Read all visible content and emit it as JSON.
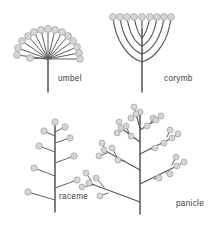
{
  "figure": {
    "background_color": "#ffffff",
    "stem_color": "#55525a",
    "bud_fill_color": "#d6d4d8",
    "bud_stroke_color": "#a9a6ad",
    "label_color": "#3d3b40"
  },
  "panels": {
    "umbel": {
      "label": "umbel",
      "label_x": 58,
      "label_y": 81,
      "hub": {
        "x": 48,
        "y": 59
      },
      "stem_bottom_y": 92,
      "ray_count": 15,
      "rays": [
        {
          "tip_x": 17,
          "tip_y": 55,
          "bud_r": 3.4
        },
        {
          "tip_x": 18,
          "tip_y": 48,
          "bud_r": 3.4
        },
        {
          "tip_x": 22,
          "tip_y": 41,
          "bud_r": 3.4
        },
        {
          "tip_x": 28,
          "tip_y": 36,
          "bud_r": 3.4
        },
        {
          "tip_x": 34,
          "tip_y": 32,
          "bud_r": 3.4
        },
        {
          "tip_x": 41,
          "tip_y": 30,
          "bud_r": 3.4
        },
        {
          "tip_x": 48,
          "tip_y": 29,
          "bud_r": 3.4
        },
        {
          "tip_x": 55,
          "tip_y": 30,
          "bud_r": 3.4
        },
        {
          "tip_x": 62,
          "tip_y": 32,
          "bud_r": 3.4
        },
        {
          "tip_x": 68,
          "tip_y": 36,
          "bud_r": 3.4
        },
        {
          "tip_x": 73,
          "tip_y": 41,
          "bud_r": 3.4
        },
        {
          "tip_x": 77,
          "tip_y": 47,
          "bud_r": 3.4
        },
        {
          "tip_x": 79,
          "tip_y": 53,
          "bud_r": 3.4
        },
        {
          "tip_x": 80,
          "tip_y": 59,
          "bud_r": 3.4
        },
        {
          "tip_x": 30,
          "tip_y": 58,
          "bud_r": 3.4
        }
      ]
    },
    "corymb": {
      "label": "corymb",
      "label_x": 164,
      "label_y": 81,
      "axis_x": 142,
      "axis_top_y": 30,
      "axis_bottom_y": 92,
      "flower_top_y": 17,
      "bud_r": 3.4,
      "branch_count": 9,
      "branches": [
        {
          "side": "left",
          "tip_x": 113,
          "attach_y": 62
        },
        {
          "side": "left",
          "tip_x": 120,
          "attach_y": 54
        },
        {
          "side": "left",
          "tip_x": 127,
          "attach_y": 46
        },
        {
          "side": "left",
          "tip_x": 134,
          "attach_y": 38
        },
        {
          "side": "center",
          "tip_x": 142,
          "attach_y": 30
        },
        {
          "side": "right",
          "tip_x": 150,
          "attach_y": 38
        },
        {
          "side": "right",
          "tip_x": 157,
          "attach_y": 46
        },
        {
          "side": "right",
          "tip_x": 164,
          "attach_y": 54
        },
        {
          "side": "right",
          "tip_x": 171,
          "attach_y": 62
        }
      ]
    },
    "raceme": {
      "label": "raceme",
      "label_x": 59,
      "label_y": 199,
      "axis_x": 55,
      "axis_top_y": 130,
      "axis_bottom_y": 212,
      "bud_r": 3.2,
      "flower_count": 9,
      "pedicels": [
        {
          "side": "left",
          "attach_y": 200,
          "tip_x": 28,
          "tip_y": 192
        },
        {
          "side": "right",
          "attach_y": 188,
          "tip_x": 77,
          "tip_y": 180
        },
        {
          "side": "left",
          "attach_y": 176,
          "tip_x": 34,
          "tip_y": 168
        },
        {
          "side": "right",
          "attach_y": 163,
          "tip_x": 74,
          "tip_y": 156
        },
        {
          "side": "left",
          "attach_y": 152,
          "tip_x": 39,
          "tip_y": 146
        },
        {
          "side": "right",
          "attach_y": 143,
          "tip_x": 70,
          "tip_y": 138
        },
        {
          "side": "left",
          "attach_y": 136,
          "tip_x": 44,
          "tip_y": 131
        },
        {
          "side": "right",
          "attach_y": 132,
          "tip_x": 65,
          "tip_y": 127
        },
        {
          "side": "center",
          "attach_y": 130,
          "tip_x": 55,
          "tip_y": 122
        }
      ]
    },
    "panicle": {
      "label": "panicle",
      "label_x": 176,
      "label_y": 206,
      "axis_x": 140,
      "axis_top_y": 128,
      "axis_bottom_y": 214,
      "bud_r": 3.0,
      "branches": [
        {
          "attach_y": 202,
          "tip_x": 89,
          "tip_y": 183,
          "sub_buds": [
            {
              "x": 100,
              "y": 196,
              "branch_x": 108,
              "branch_y": 193
            },
            {
              "x": 96,
              "y": 178,
              "branch_x": 104,
              "branch_y": 187
            },
            {
              "x": 82,
              "y": 187,
              "branch_x": 93,
              "branch_y": 185
            },
            {
              "x": 86,
              "y": 173,
              "branch_x": 92,
              "branch_y": 182
            }
          ]
        },
        {
          "attach_y": 184,
          "tip_x": 177,
          "tip_y": 166,
          "sub_buds": [
            {
              "x": 159,
              "y": 178,
              "branch_x": 154,
              "branch_y": 179
            },
            {
              "x": 170,
              "y": 174,
              "branch_x": 166,
              "branch_y": 173
            },
            {
              "x": 184,
              "y": 162,
              "branch_x": 177,
              "branch_y": 166
            },
            {
              "x": 176,
              "y": 157,
              "branch_x": 172,
              "branch_y": 165
            }
          ]
        },
        {
          "attach_y": 170,
          "tip_x": 104,
          "tip_y": 150,
          "sub_buds": [
            {
              "x": 118,
              "y": 160,
              "branch_x": 124,
              "branch_y": 161
            },
            {
              "x": 112,
              "y": 148,
              "branch_x": 117,
              "branch_y": 157
            },
            {
              "x": 99,
              "y": 156,
              "branch_x": 107,
              "branch_y": 153
            },
            {
              "x": 102,
              "y": 143,
              "branch_x": 106,
              "branch_y": 151
            }
          ]
        },
        {
          "attach_y": 154,
          "tip_x": 172,
          "tip_y": 138,
          "sub_buds": [
            {
              "x": 155,
              "y": 148,
              "branch_x": 151,
              "branch_y": 149
            },
            {
              "x": 164,
              "y": 143,
              "branch_x": 161,
              "branch_y": 144
            },
            {
              "x": 178,
              "y": 134,
              "branch_x": 172,
              "branch_y": 138
            },
            {
              "x": 170,
              "y": 130,
              "branch_x": 167,
              "branch_y": 137
            }
          ]
        },
        {
          "attach_y": 142,
          "tip_x": 121,
          "tip_y": 128,
          "sub_buds": [
            {
              "x": 131,
              "y": 136,
              "branch_x": 134,
              "branch_y": 138
            },
            {
              "x": 126,
              "y": 126,
              "branch_x": 129,
              "branch_y": 133
            },
            {
              "x": 117,
              "y": 133,
              "branch_x": 123,
              "branch_y": 130
            },
            {
              "x": 119,
              "y": 122,
              "branch_x": 122,
              "branch_y": 129
            }
          ]
        },
        {
          "attach_y": 130,
          "tip_x": 156,
          "tip_y": 120,
          "sub_buds": [
            {
              "x": 147,
              "y": 126,
              "branch_x": 145,
              "branch_y": 127
            },
            {
              "x": 153,
              "y": 118,
              "branch_x": 151,
              "branch_y": 123
            },
            {
              "x": 161,
              "y": 116,
              "branch_x": 156,
              "branch_y": 120
            }
          ]
        },
        {
          "attach_y": 128,
          "tip_x": 136,
          "tip_y": 114,
          "sub_buds": [
            {
              "x": 131,
              "y": 118,
              "branch_x": 134,
              "branch_y": 120
            },
            {
              "x": 140,
              "y": 112,
              "branch_x": 137,
              "branch_y": 117
            },
            {
              "x": 134,
              "y": 107,
              "branch_x": 136,
              "branch_y": 113
            }
          ]
        }
      ]
    }
  }
}
